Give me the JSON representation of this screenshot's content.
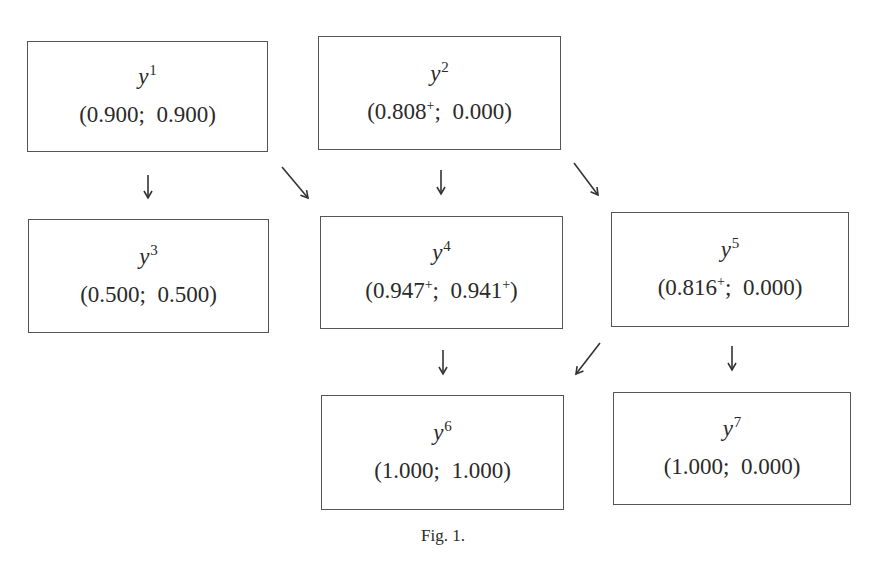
{
  "diagram": {
    "type": "flow",
    "caption": "Fig. 1.",
    "nodes": [
      {
        "id": "y1",
        "base": "y",
        "index": "1",
        "value_a": "0.900",
        "value_a_sup": "",
        "value_b": "0.900",
        "value_b_sup": ""
      },
      {
        "id": "y2",
        "base": "y",
        "index": "2",
        "value_a": "0.808",
        "value_a_sup": "+",
        "value_b": "0.000",
        "value_b_sup": ""
      },
      {
        "id": "y3",
        "base": "y",
        "index": "3",
        "value_a": "0.500",
        "value_a_sup": "",
        "value_b": "0.500",
        "value_b_sup": ""
      },
      {
        "id": "y4",
        "base": "y",
        "index": "4",
        "value_a": "0.947",
        "value_a_sup": "+",
        "value_b": "0.941",
        "value_b_sup": "+"
      },
      {
        "id": "y5",
        "base": "y",
        "index": "5",
        "value_a": "0.816",
        "value_a_sup": "+",
        "value_b": "0.000",
        "value_b_sup": ""
      },
      {
        "id": "y6",
        "base": "y",
        "index": "6",
        "value_a": "1.000",
        "value_a_sup": "",
        "value_b": "1.000",
        "value_b_sup": ""
      },
      {
        "id": "y7",
        "base": "y",
        "index": "7",
        "value_a": "1.000",
        "value_a_sup": "",
        "value_b": "0.000",
        "value_b_sup": ""
      }
    ],
    "edges": [
      {
        "from": "y1",
        "to": "y3",
        "direction": "down"
      },
      {
        "from": "y1",
        "to": "y4",
        "direction": "down-right"
      },
      {
        "from": "y2",
        "to": "y4",
        "direction": "down"
      },
      {
        "from": "y2",
        "to": "y5",
        "direction": "down-right"
      },
      {
        "from": "y4",
        "to": "y6",
        "direction": "down"
      },
      {
        "from": "y5",
        "to": "y6",
        "direction": "down-left"
      },
      {
        "from": "y5",
        "to": "y7",
        "direction": "down"
      }
    ],
    "punctuation": {
      "open": "(",
      "separator": ";  ",
      "close": ")"
    }
  }
}
